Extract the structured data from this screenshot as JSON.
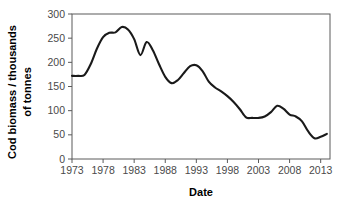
{
  "chart_data": {
    "type": "line",
    "title": "",
    "xlabel": "Date",
    "ylabel": "Cod biomass / thousands of tonnes",
    "ylabel_line1": "Cod biomass / thousands",
    "ylabel_line2": "of tonnes",
    "xlim": [
      1973,
      1974.5
    ],
    "ylim": [
      0,
      300
    ],
    "x_ticks": [
      1973,
      1978,
      1983,
      1988,
      1993,
      1998,
      2003,
      2008,
      2013
    ],
    "x_tick_labels": [
      "1973",
      "1978",
      "1983",
      "1988",
      "1993",
      "1998",
      "2003",
      "2008",
      "2013"
    ],
    "y_ticks": [
      0,
      50,
      100,
      150,
      200,
      250,
      300
    ],
    "y_tick_labels": [
      "0",
      "50",
      "100",
      "150",
      "200",
      "250",
      "300"
    ],
    "x_axis_min": 1973,
    "x_axis_max": 2014.5,
    "grid": false,
    "legend": "none",
    "line_color": "#1a1a1a",
    "x": [
      1973,
      1974,
      1975,
      1976,
      1977,
      1978,
      1979,
      1980,
      1981,
      1982,
      1983,
      1984,
      1985,
      1986,
      1987,
      1988,
      1989,
      1990,
      1991,
      1992,
      1993,
      1994,
      1995,
      1996,
      1997,
      1998,
      1999,
      2000,
      2001,
      2002,
      2003,
      2004,
      2005,
      2006,
      2007,
      2008,
      2009,
      2010,
      2011,
      2012,
      2013,
      2014
    ],
    "values": [
      172,
      172,
      174,
      196,
      228,
      252,
      261,
      262,
      273,
      268,
      248,
      215,
      242,
      225,
      196,
      170,
      157,
      163,
      178,
      192,
      194,
      182,
      160,
      148,
      140,
      130,
      118,
      103,
      86,
      85,
      85,
      88,
      97,
      110,
      104,
      92,
      88,
      78,
      57,
      43,
      46,
      52
    ],
    "series": [
      {
        "name": "Cod biomass",
        "values": [
          172,
          172,
          174,
          196,
          228,
          252,
          261,
          262,
          273,
          268,
          248,
          215,
          242,
          225,
          196,
          170,
          157,
          163,
          178,
          192,
          194,
          182,
          160,
          148,
          140,
          130,
          118,
          103,
          86,
          85,
          85,
          88,
          97,
          110,
          104,
          92,
          88,
          78,
          57,
          43,
          46,
          52
        ]
      }
    ],
    "units": "thousands of tonnes",
    "notes": {
      "peak_year": 1981,
      "peak_value": 273,
      "min_year": 2012,
      "min_value": 43,
      "start_value": 172,
      "end_value": 52
    }
  },
  "axes": {
    "x_title": "Date",
    "y_title_line1": "Cod biomass / thousands",
    "y_title_line2": "of tonnes"
  }
}
